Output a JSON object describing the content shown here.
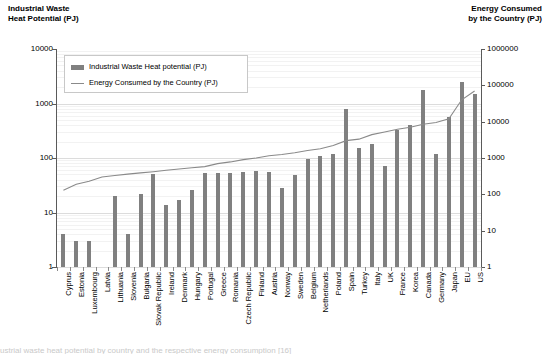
{
  "left_axis": {
    "title": "Industrial Waste\nHeat Potential (PJ)",
    "ticks": [
      "10000",
      "1000",
      "100",
      "10",
      "1"
    ]
  },
  "right_axis": {
    "title": "Energy Consumed\nby the Country (PJ)",
    "ticks": [
      "1000000",
      "100000",
      "10000",
      "1000",
      "100",
      "10",
      "1"
    ]
  },
  "legend": {
    "bar_label": "Industrial Waste Heat potential (PJ)",
    "line_label": "Energy Consumed by the Country (PJ)"
  },
  "colors": {
    "bar": "#808080",
    "line": "#8a8a8a",
    "axis": "#5a5a5a",
    "grid": "#e3e3e3"
  },
  "caption": "ustrial waste heat potential by country and the respective energy consumption [16]",
  "chart_data": {
    "type": "bar",
    "xlabel": "",
    "ylabel": "Industrial Waste Heat Potential (PJ)",
    "y2label": "Energy Consumed by the Country (PJ)",
    "yscale": "log",
    "ylim": [
      1,
      10000
    ],
    "y2lim": [
      1,
      1000000
    ],
    "grid": true,
    "legend_position": "upper-left-inside",
    "categories": [
      "Cyprus",
      "Estonia",
      "Luxembourg",
      "Latvia",
      "Lithuania",
      "Slovenia",
      "Bulgaria",
      "Slovak Republic",
      "Ireland",
      "Denmark",
      "Hungary",
      "Portugal",
      "Greece",
      "Romania",
      "Czech Republic",
      "Finland",
      "Austria",
      "Norway",
      "Sweden",
      "Belgium",
      "Netherlands",
      "Poland",
      "Spain",
      "Turkey",
      "Italy",
      "UK",
      "France",
      "Korea",
      "Canada",
      "Germany",
      "Japan",
      "EU",
      "US"
    ],
    "series": [
      {
        "name": "Industrial Waste Heat potential (PJ)",
        "type": "bar",
        "axis": "left",
        "unit": "PJ",
        "values": [
          4,
          3,
          3,
          null,
          20,
          4,
          22,
          50,
          14,
          17,
          26,
          52,
          52,
          52,
          55,
          58,
          55,
          28,
          48,
          95,
          110,
          120,
          800,
          150,
          180,
          72,
          330,
          400,
          1800,
          120,
          560,
          2500,
          1500
        ]
      },
      {
        "name": "Energy Consumed by the Country (PJ)",
        "type": "line",
        "axis": "right",
        "unit": "PJ",
        "values": [
          130,
          190,
          230,
          300,
          330,
          360,
          390,
          420,
          460,
          500,
          540,
          580,
          700,
          780,
          900,
          1000,
          1150,
          1250,
          1400,
          1600,
          1800,
          2200,
          3000,
          3300,
          4400,
          5200,
          6200,
          7000,
          8500,
          9500,
          12000,
          40000,
          70000
        ]
      }
    ]
  }
}
